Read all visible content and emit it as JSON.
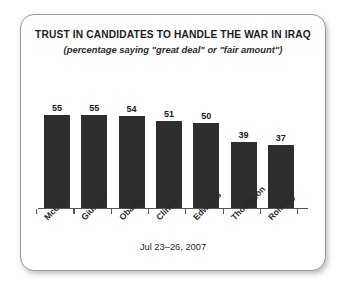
{
  "panel": {
    "border_color": "#9a9a9a",
    "background": "#ffffff"
  },
  "chart_data": {
    "type": "bar",
    "title": "TRUST IN CANDIDATES TO HANDLE THE WAR IN IRAQ",
    "subtitle": "(percentage saying \"great deal\" or \"fair amount\")",
    "categories": [
      "McCain",
      "Giuliani",
      "Obama",
      "Clinton",
      "Edwards",
      "Thompson",
      "Romney"
    ],
    "values": [
      55,
      55,
      54,
      51,
      50,
      39,
      37
    ],
    "value_labels": [
      "55",
      "55",
      "54",
      "51",
      "50",
      "39",
      "37"
    ],
    "xlabel": "",
    "ylabel": "",
    "ylim": [
      0,
      60
    ],
    "grid": false,
    "legend": false,
    "bar_color": "#2e2e2e",
    "axis_color": "#55565a",
    "footnote": "Jul 23–26, 2007"
  }
}
